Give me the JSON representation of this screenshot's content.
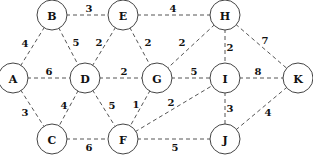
{
  "graph": {
    "type": "weighted-undirected",
    "node_radius": 15,
    "nodes": [
      {
        "id": "A",
        "label": "A",
        "x": 13,
        "y": 78
      },
      {
        "id": "B",
        "label": "B",
        "x": 52,
        "y": 15
      },
      {
        "id": "C",
        "label": "C",
        "x": 52,
        "y": 139
      },
      {
        "id": "D",
        "label": "D",
        "x": 85,
        "y": 78
      },
      {
        "id": "E",
        "label": "E",
        "x": 123,
        "y": 15
      },
      {
        "id": "F",
        "label": "F",
        "x": 123,
        "y": 139
      },
      {
        "id": "G",
        "label": "G",
        "x": 157,
        "y": 78
      },
      {
        "id": "H",
        "label": "H",
        "x": 225,
        "y": 15
      },
      {
        "id": "I",
        "label": "I",
        "x": 225,
        "y": 78
      },
      {
        "id": "J",
        "label": "J",
        "x": 225,
        "y": 139
      },
      {
        "id": "K",
        "label": "K",
        "x": 298,
        "y": 78
      }
    ],
    "edges": [
      {
        "from": "A",
        "to": "B",
        "weight": "4",
        "lx": 25,
        "ly": 43
      },
      {
        "from": "B",
        "to": "E",
        "weight": "3",
        "lx": 89,
        "ly": 8
      },
      {
        "from": "E",
        "to": "H",
        "weight": "4",
        "lx": 173,
        "ly": 8
      },
      {
        "from": "B",
        "to": "D",
        "weight": "5",
        "lx": 76,
        "ly": 42
      },
      {
        "from": "E",
        "to": "D",
        "weight": "2",
        "lx": 99,
        "ly": 42
      },
      {
        "from": "E",
        "to": "G",
        "weight": "2",
        "lx": 148,
        "ly": 42
      },
      {
        "from": "H",
        "to": "G",
        "weight": "2",
        "lx": 182,
        "ly": 42
      },
      {
        "from": "H",
        "to": "I",
        "weight": "2",
        "lx": 230,
        "ly": 47
      },
      {
        "from": "H",
        "to": "K",
        "weight": "7",
        "lx": 265,
        "ly": 40
      },
      {
        "from": "A",
        "to": "D",
        "weight": "6",
        "lx": 49,
        "ly": 71
      },
      {
        "from": "D",
        "to": "G",
        "weight": "2",
        "lx": 124,
        "ly": 71
      },
      {
        "from": "G",
        "to": "I",
        "weight": "5",
        "lx": 194,
        "ly": 71
      },
      {
        "from": "I",
        "to": "K",
        "weight": "8",
        "lx": 258,
        "ly": 71
      },
      {
        "from": "A",
        "to": "C",
        "weight": "3",
        "lx": 25,
        "ly": 112
      },
      {
        "from": "D",
        "to": "C",
        "weight": "4",
        "lx": 64,
        "ly": 105
      },
      {
        "from": "D",
        "to": "F",
        "weight": "5",
        "lx": 112,
        "ly": 105
      },
      {
        "from": "G",
        "to": "F",
        "weight": "1",
        "lx": 136,
        "ly": 104
      },
      {
        "from": "F",
        "to": "I",
        "weight": "2",
        "lx": 171,
        "ly": 102
      },
      {
        "from": "C",
        "to": "F",
        "weight": "6",
        "lx": 89,
        "ly": 147
      },
      {
        "from": "F",
        "to": "J",
        "weight": "5",
        "lx": 175,
        "ly": 147
      },
      {
        "from": "I",
        "to": "J",
        "weight": "3",
        "lx": 230,
        "ly": 108
      },
      {
        "from": "K",
        "to": "J",
        "weight": "4",
        "lx": 268,
        "ly": 112
      }
    ]
  }
}
